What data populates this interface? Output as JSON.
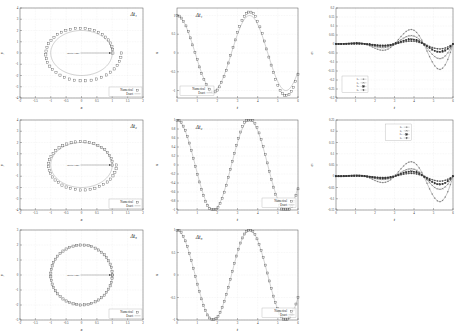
{
  "figure": {
    "rows": 3,
    "cols": 3
  },
  "labels": {
    "dt1": "Δt₁",
    "dt2": "Δt₂",
    "dt3": "Δt₃",
    "x_axis_orbit": "x",
    "y_axis_orbit": "y",
    "x_axis_time": "t",
    "y_axis_x": "x",
    "y_axis_err": "eᵢ",
    "initial_point": "initial time",
    "legend_numerical": "Numerical",
    "legend_exact": "Exact",
    "err_series_1": "eₓ",
    "err_series_2": "eᵧ",
    "err_series_3": "eᵤ",
    "err_series_4": "eᵥ"
  },
  "colors": {
    "exact_line": "#999999",
    "numerical": "#333333",
    "frame": "#555555",
    "grid": "#d8d8d8"
  },
  "chart_data": [
    {
      "id": "orbit-dt1",
      "type": "scatter",
      "title": "Δt₁",
      "xlabel": "x",
      "ylabel": "y",
      "xlim": [
        -2,
        2
      ],
      "ylim": [
        -4,
        4
      ],
      "xticks": [
        -2,
        -1.5,
        -1,
        -0.5,
        0,
        0.5,
        1,
        1.5,
        2
      ],
      "yticks": [
        -4,
        -3,
        -2,
        -1,
        0,
        1,
        2,
        3,
        4
      ],
      "grid": true,
      "legend": [
        "Numerical",
        "Exact"
      ],
      "legend_position": "bottom-right",
      "annotation": "initial time",
      "series": [
        {
          "name": "Exact",
          "kind": "line",
          "shape": "circle",
          "radius_x": 1.0,
          "radius_y": 2.0
        },
        {
          "name": "Numerical",
          "kind": "markers",
          "shape": "spiral",
          "radius_x_start": 1.02,
          "radius_x_end": 1.3,
          "radius_y_start": 2.05,
          "radius_y_end": 2.62,
          "n_points": 44
        }
      ]
    },
    {
      "id": "x-vs-t-dt1",
      "type": "line",
      "title": "Δt₁",
      "xlabel": "t",
      "ylabel": "x",
      "xlim": [
        0,
        6
      ],
      "ylim": [
        -1.2,
        1.2
      ],
      "xticks": [
        0,
        1,
        2,
        3,
        4,
        5,
        6
      ],
      "yticks": [
        -1,
        -0.5,
        0,
        0.5,
        1
      ],
      "grid": true,
      "legend": [
        "Numerical",
        "Exact"
      ],
      "legend_position": "bottom-left",
      "series": [
        {
          "name": "Exact",
          "kind": "line",
          "amplitude": 1.0,
          "period": 3.6,
          "decay": 0.0
        },
        {
          "name": "Numerical",
          "kind": "markers",
          "amplitude_growth": 0.16,
          "period": 3.6,
          "n_points": 55
        }
      ]
    },
    {
      "id": "error-dt1",
      "type": "line",
      "title": "",
      "xlabel": "t",
      "ylabel": "eᵢ",
      "xlim": [
        0,
        6
      ],
      "ylim": [
        -0.3,
        0.2
      ],
      "xticks": [
        0,
        1,
        2,
        3,
        4,
        5,
        6
      ],
      "yticks": [
        0.2,
        0.15,
        0.1,
        0.05,
        0,
        -0.05,
        -0.1,
        -0.15,
        -0.2,
        -0.25,
        -0.3
      ],
      "grid": true,
      "legend": [
        "eₓ",
        "eᵧ",
        "eᵤ",
        "eᵥ"
      ],
      "legend_position": "bottom-left",
      "series": [
        {
          "name": "eₓ",
          "amplitude": 0.175,
          "phase": 0.0,
          "marker": "plus"
        },
        {
          "name": "eᵧ",
          "amplitude": 0.105,
          "phase": 0.0,
          "marker": "cross"
        },
        {
          "name": "eᵤ",
          "amplitude": 0.055,
          "phase": 0.0,
          "marker": "square-filled"
        },
        {
          "name": "eᵥ",
          "amplitude": 0.035,
          "phase": 0.0,
          "marker": "diamond"
        }
      ]
    },
    {
      "id": "orbit-dt2",
      "type": "scatter",
      "title": "Δt₂",
      "xlabel": "x",
      "ylabel": "y",
      "xlim": [
        -2,
        2
      ],
      "ylim": [
        -4,
        4
      ],
      "xticks": [
        -2,
        -1.5,
        -1,
        -0.5,
        0,
        0.5,
        1,
        1.5,
        2
      ],
      "yticks": [
        -4,
        -3,
        -2,
        -1,
        0,
        1,
        2,
        3,
        4
      ],
      "grid": true,
      "legend": [
        "Numerical",
        "Exact"
      ],
      "legend_position": "bottom-right",
      "annotation": "initial time",
      "series": [
        {
          "name": "Exact",
          "kind": "line",
          "shape": "circle",
          "radius_x": 1.0,
          "radius_y": 2.0
        },
        {
          "name": "Numerical",
          "kind": "markers",
          "shape": "spiral",
          "radius_x_start": 1.0,
          "radius_x_end": 1.14,
          "radius_y_start": 2.0,
          "radius_y_end": 2.3,
          "n_points": 44
        }
      ]
    },
    {
      "id": "x-vs-t-dt2",
      "type": "line",
      "title": "Δt₂",
      "xlabel": "t",
      "ylabel": "x",
      "xlim": [
        0,
        6
      ],
      "ylim": [
        -1.0,
        1.0
      ],
      "xticks": [
        0,
        1,
        2,
        3,
        4,
        5,
        6
      ],
      "yticks": [
        -1,
        -0.8,
        -0.6,
        -0.4,
        -0.2,
        0,
        0.2,
        0.4,
        0.6,
        0.8,
        1
      ],
      "grid": true,
      "legend": [
        "Numerical",
        "Exact"
      ],
      "legend_position": "bottom-right",
      "series": [
        {
          "name": "Exact",
          "kind": "line",
          "amplitude": 1.0,
          "period": 3.6
        },
        {
          "name": "Numerical",
          "kind": "markers",
          "amplitude_growth": 0.06,
          "period": 3.6,
          "n_points": 60
        }
      ]
    },
    {
      "id": "error-dt2",
      "type": "line",
      "title": "",
      "xlabel": "t",
      "ylabel": "eᵢ",
      "xlim": [
        0,
        6
      ],
      "ylim": [
        -0.15,
        0.25
      ],
      "xticks": [
        0,
        1,
        2,
        3,
        4,
        5,
        6
      ],
      "yticks": [
        0.25,
        0.2,
        0.15,
        0.1,
        0.05,
        0,
        -0.05,
        -0.1,
        -0.15
      ],
      "grid": true,
      "legend": [
        "eₓ",
        "eᵧ",
        "eᵤ",
        "eᵥ"
      ],
      "legend_position": "top-center",
      "series": [
        {
          "name": "eₓ",
          "amplitude": 0.14,
          "phase": 0.0,
          "marker": "plus"
        },
        {
          "name": "eᵧ",
          "amplitude": 0.075,
          "phase": 0.0,
          "marker": "cross"
        },
        {
          "name": "eᵤ",
          "amplitude": 0.045,
          "phase": 0.0,
          "marker": "square-filled"
        },
        {
          "name": "eᵥ",
          "amplitude": 0.028,
          "phase": 0.0,
          "marker": "diamond"
        }
      ]
    },
    {
      "id": "orbit-dt3",
      "type": "scatter",
      "title": "Δt₃",
      "xlabel": "x",
      "ylabel": "y",
      "xlim": [
        -2,
        2
      ],
      "ylim": [
        -3,
        3
      ],
      "xticks": [
        -2,
        -1.5,
        -1,
        -0.5,
        0,
        0.5,
        1,
        1.5,
        2
      ],
      "yticks": [
        -3,
        -2,
        -1,
        0,
        1,
        2,
        3
      ],
      "grid": true,
      "legend": [
        "Numerical",
        "Exact"
      ],
      "legend_position": "bottom-right",
      "annotation": "initial time",
      "series": [
        {
          "name": "Exact",
          "kind": "line",
          "shape": "circle",
          "radius_x": 1.0,
          "radius_y": 2.0
        },
        {
          "name": "Numerical",
          "kind": "markers",
          "shape": "circle",
          "radius_x": 1.0,
          "radius_y": 2.0,
          "n_points": 52
        }
      ]
    },
    {
      "id": "x-vs-t-dt3",
      "type": "line",
      "title": "Δt₃",
      "xlabel": "t",
      "ylabel": "x",
      "xlim": [
        0,
        6
      ],
      "ylim": [
        -1.0,
        1.0
      ],
      "xticks": [
        0,
        1,
        2,
        3,
        4,
        5,
        6
      ],
      "yticks": [
        -1,
        -0.5,
        0,
        0.5,
        1
      ],
      "grid": true,
      "legend": [
        "Numerical",
        "Exact"
      ],
      "legend_position": "bottom-right",
      "series": [
        {
          "name": "Exact",
          "kind": "line",
          "amplitude": 1.0,
          "period": 3.6
        },
        {
          "name": "Numerical",
          "kind": "markers",
          "amplitude_growth": 0.0,
          "period": 3.6,
          "n_points": 60
        }
      ]
    },
    {
      "id": "error-dt3",
      "type": "line",
      "title": "",
      "xlabel": "t",
      "ylabel": "eᵢ",
      "xlim": [
        -0.004,
        0.004
      ],
      "xticks": [
        0,
        1,
        2,
        3,
        4,
        5,
        6
      ],
      "yticks": [
        0.004,
        0.003,
        0.002,
        0.001,
        0,
        -0.001,
        -0.002,
        -0.003,
        -0.004
      ],
      "grid": true,
      "legend": [
        "eₓ",
        "eᵧ",
        "eᵤ",
        "eᵥ"
      ],
      "legend_position": "bottom-center",
      "series": [
        {
          "name": "eₓ",
          "amplitude": 0.0028,
          "phase": 0.0,
          "marker": "plus"
        },
        {
          "name": "eᵧ",
          "amplitude": 0.0012,
          "phase": 0.0,
          "marker": "cross"
        },
        {
          "name": "eᵤ",
          "amplitude": 0.0006,
          "phase": 0.0,
          "marker": "square-filled"
        },
        {
          "name": "eᵥ",
          "amplitude": 0.0004,
          "phase": 0.0,
          "marker": "diamond"
        }
      ]
    }
  ]
}
